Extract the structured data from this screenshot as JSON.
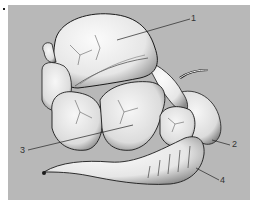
{
  "figure": {
    "background_color": "#b8b8b8",
    "organ_fill": "#f2f2f2",
    "outline_color": "#1a1a1a",
    "labels": [
      {
        "id": "1",
        "text": "1",
        "x": 191,
        "y": 14
      },
      {
        "id": "2",
        "text": "2",
        "x": 232,
        "y": 140
      },
      {
        "id": "3",
        "text": "3",
        "x": 20,
        "y": 146
      },
      {
        "id": "4",
        "text": "4",
        "x": 220,
        "y": 176
      }
    ]
  }
}
